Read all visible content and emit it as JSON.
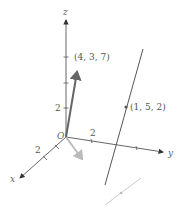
{
  "diagram": {
    "axes": {
      "x": {
        "label": "x",
        "tick_label": "2"
      },
      "y": {
        "label": "y",
        "tick_label": "2"
      },
      "z": {
        "label": "z",
        "tick_label": "2"
      },
      "origin_label": "O"
    },
    "vector": {
      "label": "(4, 3, 7)"
    },
    "line_point": {
      "label": "(1, 5, 2)"
    },
    "colors": {
      "axis": "#555555",
      "vector": "#666666",
      "line": "#555555",
      "projection": "#bbbbbb",
      "projection_line": "#cccccc",
      "text": "#555555"
    }
  }
}
